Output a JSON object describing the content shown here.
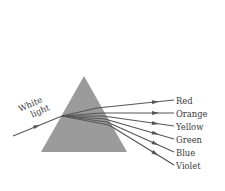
{
  "diagram": {
    "input_label_line1": "White",
    "input_label_line2": "light",
    "prism": {
      "apex": [
        84,
        76
      ],
      "base_left": [
        41,
        152
      ],
      "base_right": [
        127,
        152
      ],
      "fill": "#9b9b9b"
    },
    "incoming_ray": {
      "from": [
        13,
        136
      ],
      "to": [
        62,
        116
      ]
    },
    "spectrum": [
      {
        "label": "Red",
        "color_name": "red",
        "exit": [
          97,
          108
        ],
        "end": [
          174,
          100
        ],
        "label_y": 104
      },
      {
        "label": "Orange",
        "color_name": "orange",
        "exit": [
          101,
          113
        ],
        "end": [
          174,
          113
        ],
        "label_y": 117
      },
      {
        "label": "Yellow",
        "color_name": "yellow",
        "exit": [
          103,
          116
        ],
        "end": [
          174,
          126
        ],
        "label_y": 130
      },
      {
        "label": "Green",
        "color_name": "green",
        "exit": [
          105,
          119
        ],
        "end": [
          174,
          139
        ],
        "label_y": 143
      },
      {
        "label": "Blue",
        "color_name": "blue",
        "exit": [
          107,
          122
        ],
        "end": [
          174,
          152
        ],
        "label_y": 156
      },
      {
        "label": "Violet",
        "color_name": "violet",
        "exit": [
          109,
          125
        ],
        "end": [
          174,
          165
        ],
        "label_y": 169
      }
    ],
    "colors": {
      "prism_fill": "#9b9b9b",
      "ray_stroke": "#555555",
      "text": "#3a3a3a",
      "background": "#ffffff"
    }
  }
}
